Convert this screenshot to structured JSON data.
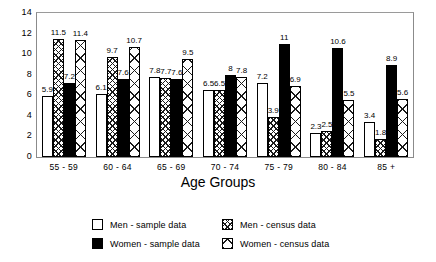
{
  "chart_data": {
    "type": "bar",
    "title": "",
    "xlabel": "Age Groups",
    "ylabel": "",
    "ylim": [
      0,
      14
    ],
    "yticks": [
      14,
      12,
      10,
      8,
      6,
      4,
      2,
      0
    ],
    "grid": false,
    "legend_position": "bottom",
    "categories": [
      "55 - 59",
      "60 - 64",
      "65 - 69",
      "70 - 74",
      "75 - 79",
      "80 - 84",
      "85 +"
    ],
    "series": [
      {
        "name": "Men - sample data",
        "pattern": "open",
        "values": [
          5.9,
          6.1,
          7.8,
          6.5,
          7.2,
          2.3,
          3.4
        ]
      },
      {
        "name": "Men - census data",
        "pattern": "fine",
        "values": [
          11.5,
          9.7,
          7.7,
          6.5,
          3.9,
          2.5,
          1.8
        ]
      },
      {
        "name": "Women - sample data",
        "pattern": "solid",
        "values": [
          7.2,
          7.6,
          7.6,
          8.0,
          11.0,
          10.6,
          8.9
        ]
      },
      {
        "name": "Women - census data",
        "pattern": "coarse",
        "values": [
          11.4,
          10.7,
          9.5,
          7.8,
          6.9,
          5.5,
          5.6
        ]
      }
    ],
    "value_labels": {
      "55 - 59": [
        "5.9",
        "11.5",
        "7.2",
        "11.4"
      ],
      "60 - 64": [
        "6.1",
        "9.7",
        "7.6",
        "10.7"
      ],
      "65 - 69": [
        "7.8",
        "7.7",
        "7.6",
        "9.5"
      ],
      "70 - 74": [
        "6.5",
        "6.5",
        "8",
        "7.8"
      ],
      "75 - 79": [
        "7.2",
        "3.9",
        "11",
        "6.9"
      ],
      "80 - 84": [
        "2.3",
        "2.5",
        "10.6",
        "5.5"
      ],
      "85 +": [
        "3.4",
        "1.8",
        "8.9",
        "5.6"
      ]
    }
  },
  "legend": {
    "entries": [
      {
        "label": "Men - sample data",
        "pattern": "open"
      },
      {
        "label": "Men - census data",
        "pattern": "fine"
      },
      {
        "label": "Women - sample data",
        "pattern": "solid"
      },
      {
        "label": "Women - census data",
        "pattern": "coarse"
      }
    ]
  },
  "caption": "",
  "colors": {
    "ink": "#000000",
    "frame": "#8b8b8b",
    "background": "#ffffff"
  }
}
